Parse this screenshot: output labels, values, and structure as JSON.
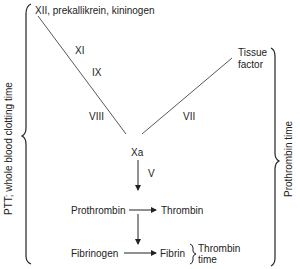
{
  "diagram": {
    "title": "",
    "nodes": {
      "intrinsic_start": "XII, prekallikrein, kininogen",
      "xi": "XI",
      "ix": "IX",
      "viii": "VIII",
      "tissue_factor_line1": "Tissue",
      "tissue_factor_line2": "factor",
      "vii": "VII",
      "xa": "Xa",
      "v": "V",
      "prothrombin": "Prothrombin",
      "thrombin": "Thrombin",
      "fibrinogen": "Fibrinogen",
      "fibrin": "Fibrin"
    },
    "brackets": {
      "left": "PTT; whole blood clotting time",
      "right": "Prothrombin time",
      "small_line1": "Thrombin",
      "small_line2": "time"
    },
    "edges": [
      {
        "from": "XII, prekallikrein, kininogen",
        "to": "Xa",
        "via": [
          "XI",
          "IX",
          "VIII"
        ],
        "type": "line"
      },
      {
        "from": "Tissue factor",
        "to": "Xa",
        "via": [
          "VII"
        ],
        "type": "line"
      },
      {
        "from": "Xa",
        "to": "Prothrombin",
        "label": "V",
        "type": "arrow"
      },
      {
        "from": "Prothrombin",
        "to": "Thrombin",
        "type": "arrow"
      },
      {
        "from": "Prothrombin",
        "to": "Fibrinogen",
        "type": "arrow"
      },
      {
        "from": "Fibrinogen",
        "to": "Fibrin",
        "type": "arrow"
      }
    ]
  }
}
